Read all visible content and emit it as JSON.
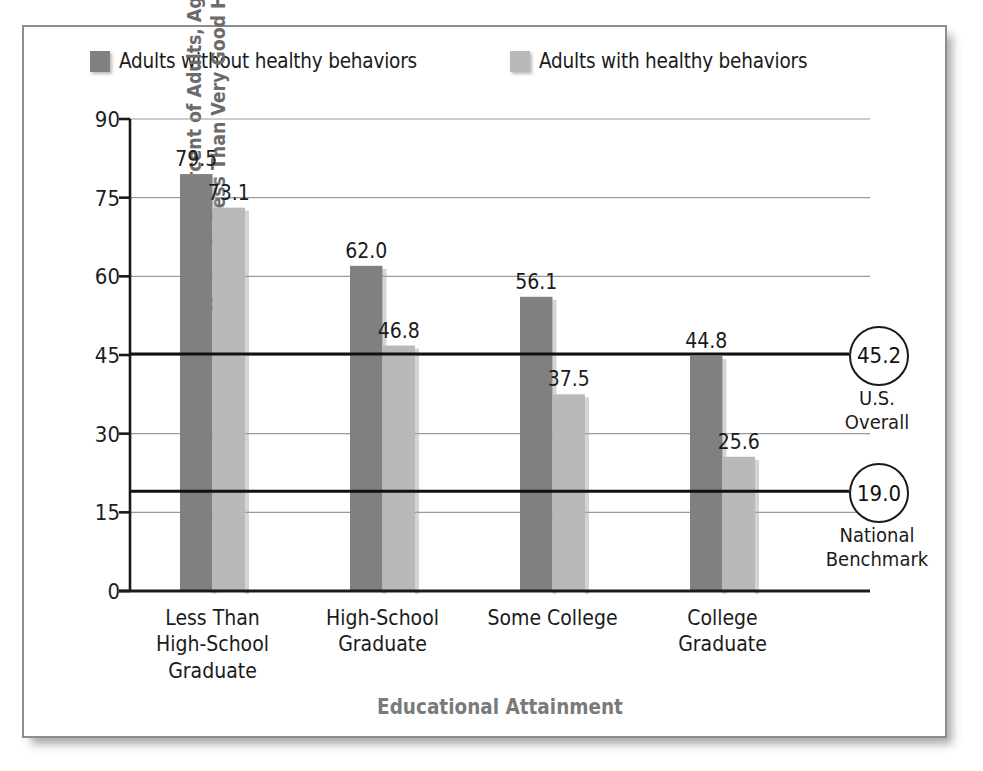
{
  "chart_data": {
    "type": "bar",
    "title": "",
    "xlabel": "Educational Attainment",
    "ylabel": "Age-Adjusted Percent of Adults, Ages 25–74 Years, in Less Than Very Good Health",
    "categories": [
      "Less Than\nHigh-School\nGraduate",
      "High-School\nGraduate",
      "Some College",
      "College\nGraduate"
    ],
    "series": [
      {
        "name": "Adults without healthy behaviors",
        "color": "#808080",
        "values": [
          79.5,
          62.0,
          56.1,
          44.8
        ],
        "labels": [
          "79.5",
          "62.0",
          "56.1",
          "44.8"
        ]
      },
      {
        "name": "Adults with healthy behaviors",
        "color": "#b9b9b9",
        "values": [
          73.1,
          46.8,
          37.5,
          25.6
        ],
        "labels": [
          "73.1",
          "46.8",
          "37.5",
          "25.6"
        ]
      }
    ],
    "ylim": [
      0,
      90
    ],
    "yticks": [
      0,
      15,
      30,
      45,
      60,
      75,
      90
    ],
    "ytick_labels": [
      "0",
      "15",
      "30",
      "45",
      "60",
      "75",
      "90"
    ],
    "grid": true,
    "grid_color": "#9a9a9a",
    "legend_position": "top",
    "reference_lines": [
      {
        "id": "us-overall",
        "value": 45.2,
        "badge": "45.2",
        "caption": "U.S.\nOverall",
        "color": "#111111"
      },
      {
        "id": "national-benchmark",
        "value": 19.0,
        "badge": "19.0",
        "caption": "National\nBenchmark",
        "color": "#111111"
      }
    ]
  },
  "legend": {
    "items": [
      {
        "label": "Adults without healthy behaviors",
        "color": "#808080"
      },
      {
        "label": "Adults with healthy behaviors",
        "color": "#b9b9b9"
      }
    ]
  },
  "axes": {
    "x_title": "Educational Attainment",
    "y_title": "Age-Adjusted Percent of Adults, Ages 25–74 Years, in Less Than Very Good Health"
  },
  "colors": {
    "frame_border": "#8d8d8d",
    "background": "#ffffff",
    "axis": "#1a1a1a",
    "gridline": "#9a9a9a",
    "axis_title": "#6b6b6b",
    "series_dark": "#808080",
    "series_light": "#b9b9b9"
  }
}
